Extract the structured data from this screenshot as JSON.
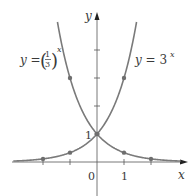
{
  "chart_data": {
    "type": "line",
    "title": "",
    "xlabel": "x",
    "ylabel": "y",
    "xlim": [
      -2.9,
      3.5
    ],
    "ylim": [
      -1,
      5.2
    ],
    "x_ticks": [
      -2,
      -1,
      1,
      2
    ],
    "y_ticks": [
      1,
      2,
      3,
      4
    ],
    "tick_labels": {
      "x_origin": "0",
      "x_one": "1",
      "y_one": "1"
    },
    "grid": false,
    "series": [
      {
        "name": "y = (1/3)^x",
        "label_prefix": "y = ",
        "base_num": "1",
        "base_den": "3",
        "exponent": "x",
        "marked_points": [
          [
            -1,
            3
          ],
          [
            0,
            1
          ],
          [
            1,
            0.3333
          ],
          [
            2,
            0.1111
          ]
        ]
      },
      {
        "name": "y = 3^x",
        "label_prefix": "y = 3",
        "exponent": "x",
        "marked_points": [
          [
            -2,
            0.1111
          ],
          [
            -1,
            0.3333
          ],
          [
            0,
            1
          ],
          [
            1,
            3
          ]
        ]
      }
    ],
    "intersection": [
      0,
      1
    ]
  },
  "colors": {
    "curve": "#7a7a7a",
    "axis": "#555555",
    "point": "#6e6e6e",
    "text": "#3a3a3a"
  }
}
